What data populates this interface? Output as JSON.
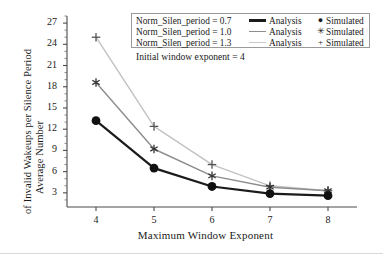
{
  "chart_data": {
    "type": "line",
    "title": "",
    "xlabel": "Maximum Window Exponent",
    "ylabel": "Average Number of Invalid Wakeups per Silence Period",
    "ylabel_line1": "Average Number",
    "ylabel_line2": "of Invalid Wakeups per Silence Period",
    "x": [
      4,
      5,
      6,
      7,
      8
    ],
    "xticks": [
      "4",
      "5",
      "6",
      "7",
      "8"
    ],
    "yticks": [
      "3",
      "6",
      "9",
      "12",
      "15",
      "18",
      "21",
      "24",
      "27"
    ],
    "xlim": [
      3.5,
      8.5
    ],
    "ylim": [
      1.0,
      28.0
    ],
    "grid": false,
    "legend_position": "top-right",
    "annotation": "Initial window exponent = 4",
    "series": [
      {
        "name": "Norm_Silen_period = 0.7",
        "analysis_label": "Analysis",
        "simulated_label": "Simulated",
        "marker": "circle",
        "color": "#1b1b1b",
        "values": [
          13.2,
          6.5,
          3.9,
          2.9,
          2.6
        ]
      },
      {
        "name": "Norm_Silen_period = 1.0",
        "analysis_label": "Analysis",
        "simulated_label": "Simulated",
        "marker": "asterisk",
        "color": "#8d8d8d",
        "values": [
          18.6,
          9.2,
          5.4,
          3.8,
          3.3
        ]
      },
      {
        "name": "Norm_Silen_period = 1.3",
        "analysis_label": "Analysis",
        "simulated_label": "Simulated",
        "marker": "plus",
        "color": "#c2c2c2",
        "values": [
          25.0,
          12.4,
          7.0,
          4.0,
          3.3
        ]
      }
    ]
  },
  "legend": {
    "rows": [
      {
        "condition": "Norm_Silen_period = 0.7",
        "analysis": "Analysis",
        "marker": "●",
        "simulated": "Simulated",
        "color": "#1b1b1b"
      },
      {
        "condition": "Norm_Silen_period = 1.0",
        "analysis": "Analysis",
        "marker": "✳",
        "simulated": "Simulated",
        "color": "#8d8d8d"
      },
      {
        "condition": "Norm_Silen_period = 1.3",
        "analysis": "Analysis",
        "marker": "+",
        "simulated": "Simulated",
        "color": "#c2c2c2"
      }
    ]
  },
  "axes": {
    "x_title": "Maximum Window Exponent",
    "y_title_line1": "Average Number",
    "y_title_line2": "of Invalid Wakeups per Silence Period"
  },
  "annotation": {
    "text": "Initial window exponent = 4"
  }
}
